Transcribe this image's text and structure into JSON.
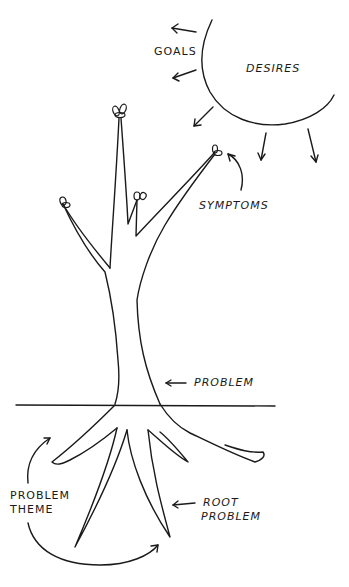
{
  "diagram": {
    "type": "problem-tree-metaphor",
    "background": "#ffffff",
    "ink_color": "#1a1a1a",
    "labels": {
      "goals": "GOALS",
      "desires": "DESIRES",
      "symptoms": "SYMPTOMS",
      "problem": "PROBLEM",
      "problem_theme_line1": "PROBLEM",
      "problem_theme_line2": "THEME",
      "root_problem_line1": "ROOT",
      "root_problem_line2": "PROBLEM"
    },
    "elements": [
      {
        "id": "sun",
        "label": "DESIRES",
        "shape": "partial-circle"
      },
      {
        "id": "goals-arrows",
        "label": "GOALS",
        "count": 2,
        "direction": "left"
      },
      {
        "id": "sun-rays",
        "count": 3,
        "direction": "down"
      },
      {
        "id": "branches",
        "label": "SYMPTOMS",
        "count": 4
      },
      {
        "id": "trunk",
        "label": "PROBLEM"
      },
      {
        "id": "ground-line"
      },
      {
        "id": "roots",
        "label": "ROOT PROBLEM",
        "count": 5
      },
      {
        "id": "problem-theme-arrow",
        "label": "PROBLEM THEME"
      }
    ]
  }
}
